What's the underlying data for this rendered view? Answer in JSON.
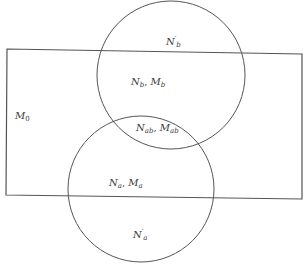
{
  "diagram": {
    "type": "venn",
    "colors": {
      "stroke": "#555555",
      "text": "#3a3a3a",
      "background": "#ffffff"
    },
    "universe": {
      "label_main": "M",
      "label_sub": "0"
    },
    "regions": {
      "b_outside": {
        "main": "N",
        "prime": "′",
        "sub": "b"
      },
      "b_inside": {
        "n_main": "N",
        "n_sub": "b",
        "sep": ", ",
        "m_main": "M",
        "m_sub": "b"
      },
      "ab_inside": {
        "n_main": "N",
        "n_sub": "ab",
        "sep": ", ",
        "m_main": "M",
        "m_sub": "ab"
      },
      "a_inside": {
        "n_main": "N",
        "n_sub": "a",
        "sep": ", ",
        "m_main": "M",
        "m_sub": "a"
      },
      "a_outside": {
        "main": "N",
        "prime": "′",
        "sub": "a"
      }
    }
  }
}
